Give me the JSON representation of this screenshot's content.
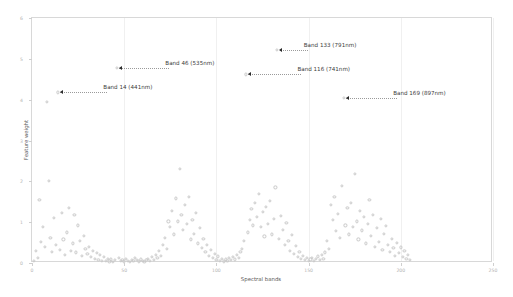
{
  "chart_data": {
    "type": "scatter",
    "title": "",
    "xlabel": "Spectral bands",
    "ylabel": "Feature weight",
    "xlim": [
      0,
      250
    ],
    "ylim": [
      0,
      6
    ],
    "xticks": [
      0,
      50,
      100,
      150,
      200,
      250
    ],
    "xticklabels": [
      "0",
      "50",
      "100",
      "150",
      "200",
      "250"
    ],
    "yticks": [
      0,
      1,
      2,
      3,
      4,
      5,
      6
    ],
    "yticklabels": [
      "0",
      "1",
      "2",
      "3",
      "4",
      "5",
      "6"
    ],
    "grid": true,
    "legend": null,
    "marker": "open-circle",
    "marker_color": "#c9c9c9",
    "points": [
      [
        1,
        0.05
      ],
      [
        2,
        0.3
      ],
      [
        3,
        0.12
      ],
      [
        4,
        1.55
      ],
      [
        5,
        0.52
      ],
      [
        6,
        0.88
      ],
      [
        7,
        0.4
      ],
      [
        8,
        3.95
      ],
      [
        9,
        2.02
      ],
      [
        10,
        0.62
      ],
      [
        11,
        0.28
      ],
      [
        12,
        1.1
      ],
      [
        13,
        0.45
      ],
      [
        14,
        4.18
      ],
      [
        15,
        0.33
      ],
      [
        16,
        1.22
      ],
      [
        17,
        0.58
      ],
      [
        18,
        0.2
      ],
      [
        19,
        0.75
      ],
      [
        20,
        1.35
      ],
      [
        21,
        0.3
      ],
      [
        22,
        0.48
      ],
      [
        23,
        1.18
      ],
      [
        24,
        0.26
      ],
      [
        25,
        0.92
      ],
      [
        26,
        0.55
      ],
      [
        27,
        0.18
      ],
      [
        28,
        0.66
      ],
      [
        29,
        0.34
      ],
      [
        30,
        0.22
      ],
      [
        31,
        0.4
      ],
      [
        32,
        0.15
      ],
      [
        33,
        0.3
      ],
      [
        34,
        0.1
      ],
      [
        35,
        0.24
      ],
      [
        36,
        0.08
      ],
      [
        37,
        0.19
      ],
      [
        38,
        0.06
      ],
      [
        39,
        0.14
      ],
      [
        40,
        0.05
      ],
      [
        41,
        0.11
      ],
      [
        42,
        0.04
      ],
      [
        43,
        0.09
      ],
      [
        44,
        0.03
      ],
      [
        45,
        0.07
      ],
      [
        46,
        4.78
      ],
      [
        47,
        0.12
      ],
      [
        48,
        0.05
      ],
      [
        49,
        0.08
      ],
      [
        50,
        0.04
      ],
      [
        51,
        0.1
      ],
      [
        52,
        0.06
      ],
      [
        53,
        0.03
      ],
      [
        54,
        0.08
      ],
      [
        55,
        0.05
      ],
      [
        56,
        0.12
      ],
      [
        57,
        0.07
      ],
      [
        58,
        0.04
      ],
      [
        59,
        0.09
      ],
      [
        60,
        0.05
      ],
      [
        61,
        0.03
      ],
      [
        62,
        0.07
      ],
      [
        63,
        0.1
      ],
      [
        64,
        0.05
      ],
      [
        65,
        0.14
      ],
      [
        66,
        0.08
      ],
      [
        67,
        0.2
      ],
      [
        68,
        0.12
      ],
      [
        69,
        0.3
      ],
      [
        70,
        0.18
      ],
      [
        71,
        0.45
      ],
      [
        72,
        0.62
      ],
      [
        73,
        0.35
      ],
      [
        74,
        1.02
      ],
      [
        75,
        0.88
      ],
      [
        76,
        1.28
      ],
      [
        77,
        0.7
      ],
      [
        78,
        1.58
      ],
      [
        79,
        1.02
      ],
      [
        80,
        2.3
      ],
      [
        81,
        1.18
      ],
      [
        82,
        0.82
      ],
      [
        83,
        1.42
      ],
      [
        84,
        0.95
      ],
      [
        85,
        1.62
      ],
      [
        86,
        0.58
      ],
      [
        87,
        1.05
      ],
      [
        88,
        0.72
      ],
      [
        89,
        1.22
      ],
      [
        90,
        0.48
      ],
      [
        91,
        0.85
      ],
      [
        92,
        0.36
      ],
      [
        93,
        0.6
      ],
      [
        94,
        0.28
      ],
      [
        95,
        0.44
      ],
      [
        96,
        0.18
      ],
      [
        97,
        0.32
      ],
      [
        98,
        0.12
      ],
      [
        99,
        0.22
      ],
      [
        100,
        0.08
      ],
      [
        101,
        0.16
      ],
      [
        102,
        0.06
      ],
      [
        103,
        0.11
      ],
      [
        104,
        0.04
      ],
      [
        105,
        0.09
      ],
      [
        106,
        0.05
      ],
      [
        107,
        0.12
      ],
      [
        108,
        0.07
      ],
      [
        109,
        0.15
      ],
      [
        110,
        0.09
      ],
      [
        111,
        0.2
      ],
      [
        112,
        0.13
      ],
      [
        113,
        0.28
      ],
      [
        114,
        0.35
      ],
      [
        115,
        0.55
      ],
      [
        116,
        4.62
      ],
      [
        117,
        0.75
      ],
      [
        118,
        1.05
      ],
      [
        119,
        1.32
      ],
      [
        120,
        0.92
      ],
      [
        121,
        1.48
      ],
      [
        122,
        1.12
      ],
      [
        123,
        1.7
      ],
      [
        124,
        0.88
      ],
      [
        125,
        1.25
      ],
      [
        126,
        0.65
      ],
      [
        127,
        1.38
      ],
      [
        128,
        0.95
      ],
      [
        129,
        1.52
      ],
      [
        130,
        0.7
      ],
      [
        131,
        1.08
      ],
      [
        132,
        1.85
      ],
      [
        133,
        5.22
      ],
      [
        134,
        0.6
      ],
      [
        135,
        1.15
      ],
      [
        136,
        0.82
      ],
      [
        137,
        0.45
      ],
      [
        138,
        0.98
      ],
      [
        139,
        0.55
      ],
      [
        140,
        0.3
      ],
      [
        141,
        0.68
      ],
      [
        142,
        0.22
      ],
      [
        143,
        0.42
      ],
      [
        144,
        0.15
      ],
      [
        145,
        0.28
      ],
      [
        146,
        0.1
      ],
      [
        147,
        0.18
      ],
      [
        148,
        0.07
      ],
      [
        149,
        0.13
      ],
      [
        150,
        0.05
      ],
      [
        151,
        0.09
      ],
      [
        152,
        0.12
      ],
      [
        153,
        0.06
      ],
      [
        154,
        0.1
      ],
      [
        155,
        0.16
      ],
      [
        156,
        0.08
      ],
      [
        157,
        0.2
      ],
      [
        158,
        0.11
      ],
      [
        159,
        0.26
      ],
      [
        160,
        0.55
      ],
      [
        161,
        0.35
      ],
      [
        162,
        1.42
      ],
      [
        163,
        1.05
      ],
      [
        164,
        1.62
      ],
      [
        165,
        0.78
      ],
      [
        166,
        1.2
      ],
      [
        167,
        0.62
      ],
      [
        168,
        1.88
      ],
      [
        169,
        4.05
      ],
      [
        170,
        0.92
      ],
      [
        171,
        1.35
      ],
      [
        172,
        0.7
      ],
      [
        173,
        1.48
      ],
      [
        174,
        0.88
      ],
      [
        175,
        2.18
      ],
      [
        176,
        1.02
      ],
      [
        177,
        0.58
      ],
      [
        178,
        1.28
      ],
      [
        179,
        0.8
      ],
      [
        180,
        1.12
      ],
      [
        181,
        0.48
      ],
      [
        182,
        0.95
      ],
      [
        183,
        1.55
      ],
      [
        184,
        0.66
      ],
      [
        185,
        1.18
      ],
      [
        186,
        0.4
      ],
      [
        187,
        0.85
      ],
      [
        188,
        0.52
      ],
      [
        189,
        1.08
      ],
      [
        190,
        0.32
      ],
      [
        191,
        0.72
      ],
      [
        192,
        0.9
      ],
      [
        193,
        0.45
      ],
      [
        194,
        0.28
      ],
      [
        195,
        0.6
      ],
      [
        196,
        0.36
      ],
      [
        197,
        0.18
      ],
      [
        198,
        0.5
      ],
      [
        199,
        0.25
      ],
      [
        200,
        0.38
      ],
      [
        201,
        0.14
      ],
      [
        202,
        0.3
      ],
      [
        203,
        0.1
      ],
      [
        204,
        0.2
      ],
      [
        205,
        0.07
      ]
    ],
    "annotations": [
      {
        "label": "Band 14 (441nm)",
        "band": 14,
        "weight": 4.18,
        "text_x": 64,
        "text_y": 4.33,
        "tail_len": 47
      },
      {
        "label": "Band 46 (535nm)",
        "band": 46,
        "weight": 4.78,
        "text_x": 130,
        "text_y": 4.95,
        "tail_len": 50
      },
      {
        "label": "Band 116 (741nm)",
        "band": 116,
        "weight": 4.62,
        "text_x": 247,
        "text_y": 4.76,
        "tail_len": 53
      },
      {
        "label": "Band 133 (791nm)",
        "band": 133,
        "weight": 5.22,
        "text_x": 287,
        "text_y": 5.38,
        "tail_len": 28
      },
      {
        "label": "Band 169 (897nm)",
        "band": 169,
        "weight": 4.05,
        "text_x": 352,
        "text_y": 4.2,
        "tail_len": 51
      }
    ]
  }
}
